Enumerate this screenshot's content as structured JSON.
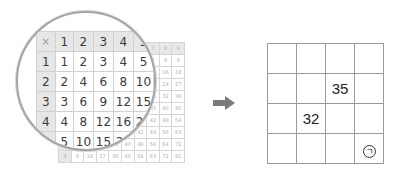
{
  "back_table": {
    "header": [
      "×",
      "1",
      "2",
      "3",
      "4",
      "5",
      "6",
      "7",
      "8",
      "9"
    ],
    "rows": [
      [
        "1",
        "1",
        "2",
        "3",
        "4",
        "5",
        "6",
        "7",
        "8",
        "9"
      ],
      [
        "2",
        "2",
        "4",
        "6",
        "8",
        "10",
        "12",
        "14",
        "16",
        "18"
      ],
      [
        "3",
        "3",
        "6",
        "9",
        "12",
        "15",
        "18",
        "21",
        "24",
        "27"
      ],
      [
        "4",
        "4",
        "8",
        "12",
        "16",
        "20",
        "24",
        "28",
        "32",
        "36"
      ],
      [
        "5",
        "5",
        "10",
        "15",
        "20",
        "25",
        "30",
        "35",
        "40",
        "45"
      ],
      [
        "6",
        "6",
        "12",
        "18",
        "24",
        "30",
        "36",
        "42",
        "48",
        "54"
      ],
      [
        "7",
        "7",
        "14",
        "21",
        "28",
        "35",
        "42",
        "49",
        "56",
        "63"
      ],
      [
        "8",
        "8",
        "16",
        "24",
        "32",
        "40",
        "48",
        "56",
        "64",
        "72"
      ],
      [
        "9",
        "9",
        "18",
        "27",
        "36",
        "45",
        "54",
        "63",
        "72",
        "81"
      ]
    ]
  },
  "magnified_table": {
    "header": [
      "×",
      "1",
      "2",
      "3",
      "4",
      "5"
    ],
    "rows": [
      [
        "1",
        "1",
        "2",
        "3",
        "4",
        "5"
      ],
      [
        "2",
        "2",
        "4",
        "6",
        "8",
        "10"
      ],
      [
        "3",
        "3",
        "6",
        "9",
        "12",
        "15"
      ],
      [
        "4",
        "4",
        "8",
        "12",
        "16",
        "20"
      ],
      [
        "5",
        "5",
        "10",
        "15",
        "20",
        "25"
      ]
    ]
  },
  "arrow_icon": "right-arrow",
  "answer_grid": {
    "rows": [
      [
        "",
        "",
        "",
        ""
      ],
      [
        "",
        "",
        "35",
        ""
      ],
      [
        "",
        "32",
        "",
        ""
      ],
      [
        "",
        "",
        "",
        "ㄱ"
      ]
    ],
    "marked_cell_label": "ㄱ"
  },
  "colors": {
    "header_bg": "#e6e6e6",
    "arrow": "#7a7a7a",
    "grid_line": "#9a9a9a",
    "magnifier_ring": "#a5a5a5"
  }
}
